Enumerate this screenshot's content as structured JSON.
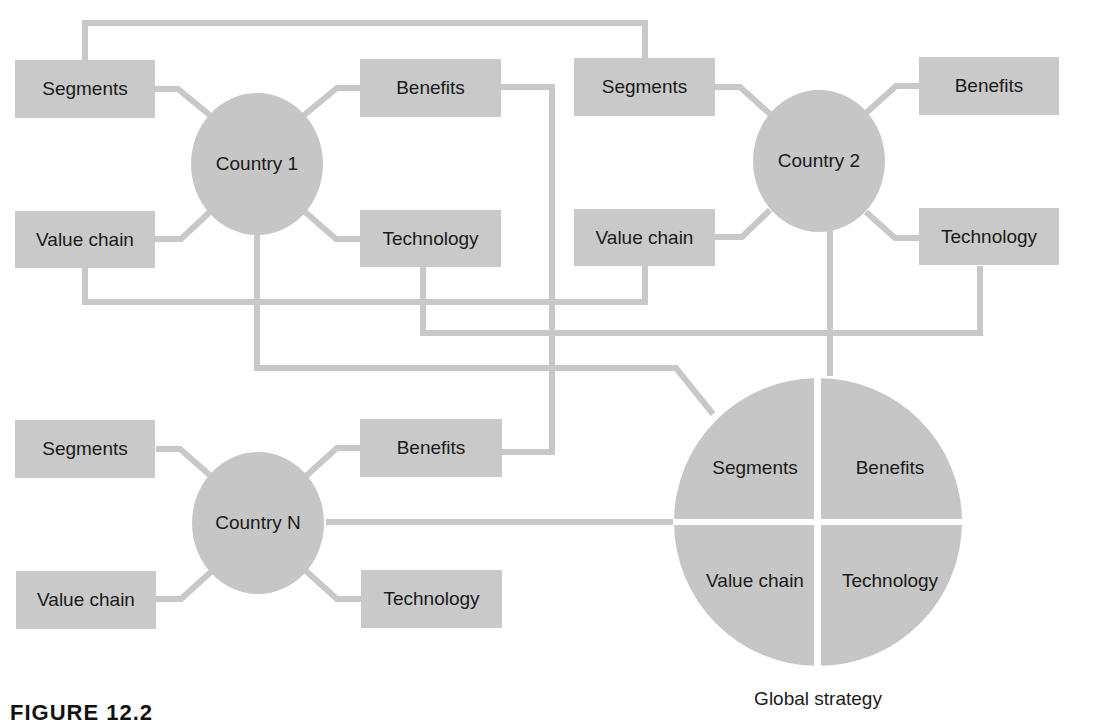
{
  "colors": {
    "box_fill": "#c9c9c9",
    "circle_fill": "#c6c6c6",
    "connector": "#c8c8c8",
    "text": "#1a1a1a",
    "background": "#ffffff"
  },
  "countries": [
    {
      "name": "Country 1",
      "segments": "Segments",
      "benefits": "Benefits",
      "value_chain": "Value chain",
      "technology": "Technology"
    },
    {
      "name": "Country 2",
      "segments": "Segments",
      "benefits": "Benefits",
      "value_chain": "Value chain",
      "technology": "Technology"
    },
    {
      "name": "Country N",
      "segments": "Segments",
      "benefits": "Benefits",
      "value_chain": "Value chain",
      "technology": "Technology"
    }
  ],
  "global": {
    "quadrants": {
      "top_left": "Segments",
      "top_right": "Benefits",
      "bottom_left": "Value chain",
      "bottom_right": "Technology"
    },
    "caption": "Global strategy"
  },
  "figure_label": "FIGURE 12.2"
}
